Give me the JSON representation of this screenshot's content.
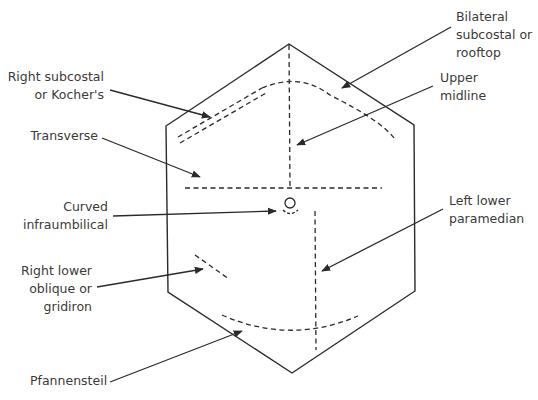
{
  "diagram": {
    "colors": {
      "line": "#2a2a2a",
      "text": "#3a3a3a",
      "background": "#ffffff"
    },
    "labels": {
      "right_subcostal": "Right subcostal\nor Kocher's",
      "transverse": "Transverse",
      "curved_infraumbilical": "Curved\ninfraumbilical",
      "right_lower_oblique": "Right lower\noblique or\ngridiron",
      "pfannenstiel": "Pfannensteil",
      "bilateral_subcostal": "Bilateral\nsubcostal or\nrooftop",
      "upper_midline": "Upper\nmidline",
      "left_lower_paramedian": "Left lower\nparamedian"
    }
  }
}
